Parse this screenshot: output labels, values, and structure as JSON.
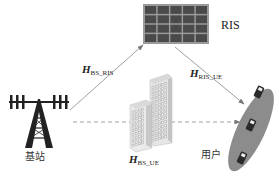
{
  "nodes": {
    "ris": {
      "label": "RIS",
      "grid_rows": 4,
      "grid_cols": 5
    },
    "base_station": {
      "label": "基站"
    },
    "users": {
      "label": "用户",
      "device_count": 3
    },
    "obstacle": {
      "label": "buildings"
    }
  },
  "channels": {
    "bs_ris": {
      "symbol": "H",
      "subscript": "BS_RIS",
      "style": "solid"
    },
    "ris_ue": {
      "symbol": "H",
      "subscript": "RIS_UE",
      "style": "solid"
    },
    "bs_ue": {
      "symbol": "H",
      "subscript": "BS_UE",
      "style": "dashed"
    }
  },
  "colors": {
    "ris_panel": "#4a4a4a",
    "ris_frame": "#9a9a9a",
    "tower": "#222222",
    "arrow": "#888888",
    "user_ellipse": "#8a8a8a",
    "building": "#cfcfcf"
  }
}
